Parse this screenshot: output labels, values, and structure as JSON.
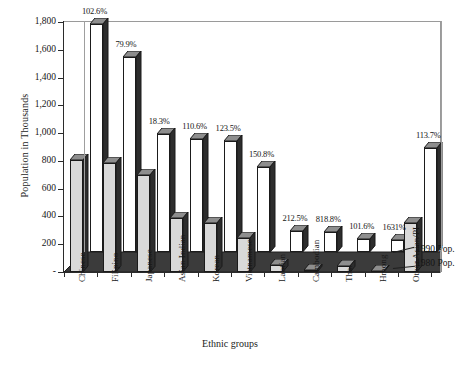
{
  "chart_data": {
    "type": "bar",
    "title": "",
    "xlabel": "Ethnic groups",
    "ylabel": "Population in Thousands",
    "ylim": [
      0,
      1800
    ],
    "ytick_labels": [
      "1,800",
      "1,600",
      "1,400",
      "1,200",
      "1,000",
      "800",
      "600",
      "400",
      "200",
      "-"
    ],
    "ytick_values": [
      1800,
      1600,
      1400,
      1200,
      1000,
      800,
      600,
      400,
      200,
      0
    ],
    "grid": false,
    "legend_position": "right",
    "categories": [
      "Chinese",
      "Filipino",
      "Japanese",
      "Asian Indian",
      "Korean",
      "Vietnamese",
      "Laotian",
      "Cambodian",
      "Thai",
      "Hmong",
      "Other Asian/PI"
    ],
    "series": [
      {
        "name": "1980 Pop.",
        "values": [
          806,
          782,
          701,
          387,
          355,
          245,
          48,
          16,
          45,
          5,
          350
        ]
      },
      {
        "name": "1990 Pop.",
        "values": [
          1645,
          1407,
          848,
          815,
          799,
          615,
          149,
          147,
          91,
          90,
          748
        ]
      }
    ],
    "growth_labels": [
      "102.6%",
      "79.9%",
      "18.3%",
      "110.6%",
      "123.5%",
      "150.8%",
      "212.5%",
      "818.8%",
      "101.6%",
      "1631%",
      "113.7%"
    ]
  },
  "legend": {
    "items": [
      {
        "label": "1990 Pop."
      },
      {
        "label": "1980 Pop."
      }
    ]
  },
  "colors": {
    "bar_1980_face": "#d9d9d9",
    "bar_1990_face": "#ffffff",
    "bar_side": "#2d2d2d",
    "bar_top": "#8e8e8e",
    "floor": "#3b3b3b",
    "axis": "#2b2b2b",
    "frame": "#9a9a9a",
    "text": "#161616"
  }
}
